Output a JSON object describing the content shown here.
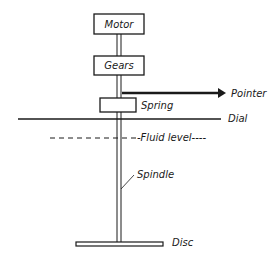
{
  "diagram": {
    "type": "viscometer-schematic",
    "components": {
      "motor": "Motor",
      "gears": "Gears",
      "spring": "Spring",
      "pointer": "Pointer",
      "dial": "Dial",
      "fluid_level": "-Fluid level----",
      "spindle": "Spindle",
      "disc": "Disc"
    },
    "colors": {
      "stroke": "#1a1a1a",
      "background": "#ffffff"
    }
  }
}
